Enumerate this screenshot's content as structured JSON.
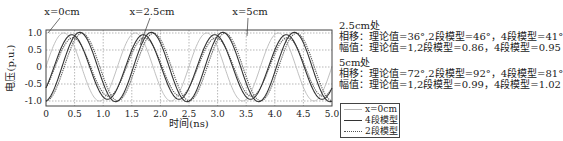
{
  "chart_data": {
    "type": "line",
    "title": "",
    "xlabel": "时间(ns)",
    "ylabel": "电压(p.u.)",
    "xlim": [
      0,
      5.0
    ],
    "ylim": [
      -1.1,
      1.1
    ],
    "x_ticks": [
      "0",
      "0.5",
      "1.0",
      "1.5",
      "2.0",
      "2.5",
      "3.0",
      "3.5",
      "4.0",
      "4.5",
      "5.0"
    ],
    "y_ticks": [
      "1.0",
      "0.5",
      "0",
      "-0.5",
      "-1.0"
    ],
    "grid": true,
    "grid_style": "dotted",
    "period_ns": 1.25,
    "series": [
      {
        "name": "x=0cm",
        "style": "solid-light-gray",
        "color": "#b8b8b8",
        "amplitude": 1.0,
        "phase_deg": 0,
        "peaks_ns": [
          0.31,
          1.56,
          2.81,
          4.06
        ]
      },
      {
        "name": "4段模型",
        "style": "solid-dark",
        "color": "#333333",
        "groups": [
          {
            "position": "2.5cm",
            "amplitude": 0.95,
            "phase_deg": 41
          },
          {
            "position": "5cm",
            "amplitude": 1.02,
            "phase_deg": 81
          }
        ]
      },
      {
        "name": "2段模型",
        "style": "dotted-dark",
        "color": "#555555",
        "groups": [
          {
            "position": "2.5cm",
            "amplitude": 0.86,
            "phase_deg": 46
          },
          {
            "position": "5cm",
            "amplitude": 0.99,
            "phase_deg": 92
          }
        ]
      }
    ],
    "theory": {
      "2.5cm": {
        "phase_deg": 36,
        "amplitude": 1
      },
      "5cm": {
        "phase_deg": 72,
        "amplitude": 1
      }
    },
    "annotations": [
      {
        "text": "x=0cm",
        "x_ns": 0.0
      },
      {
        "text": "x=2.5cm",
        "x_ns": 1.55
      },
      {
        "text": "x=5cm",
        "x_ns": 2.92
      }
    ],
    "legend_position": "lower-right-outside"
  },
  "annotations": {
    "x0": "x=0cm",
    "x25": "x=2.5cm",
    "x5": "x=5cm"
  },
  "info": {
    "block1": {
      "head": "2.5cm处",
      "phase": "相移：理论值=36°,2段模型=46°，4段模型=41°",
      "amp": "幅值：理论值=1,2段模型=0.86，4段模型=0.95"
    },
    "block2": {
      "head": "5cm处",
      "phase": "相移：理论值=72°,2段模型=92°，4段模型=81°",
      "amp": "幅值：理论值=1,2段模型=0.99，4段模型=1.02"
    }
  },
  "legend": {
    "items": [
      {
        "label": "x=0cm"
      },
      {
        "label": "4段模型"
      },
      {
        "label": "2段模型"
      }
    ]
  },
  "axes": {
    "xlabel": "时间(ns)",
    "ylabel": "电压(p.u.)"
  }
}
